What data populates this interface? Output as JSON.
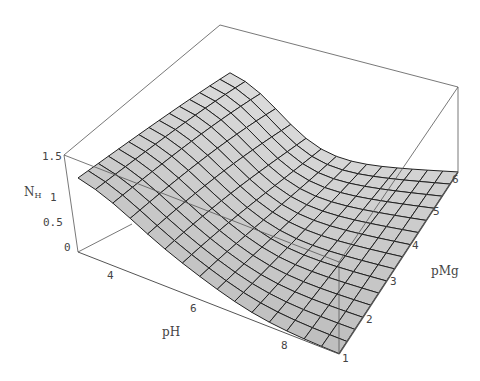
{
  "chart_data": {
    "type": "surface3d",
    "title": "",
    "x_axis": {
      "label": "pH",
      "ticks": [
        4,
        6,
        8
      ],
      "range": [
        3,
        9
      ]
    },
    "y_axis": {
      "label": "pMg",
      "ticks": [
        1,
        2,
        3,
        4,
        5,
        6
      ],
      "range": [
        1,
        6
      ]
    },
    "z_axis": {
      "label": "N",
      "label_subscript": "H",
      "ticks": [
        "0",
        "0.5",
        "1",
        "1.5"
      ],
      "range": [
        0,
        1.6
      ]
    },
    "grid": {
      "nx": 15,
      "ny": 15
    },
    "colors": {
      "surface": "#d0d0d0",
      "mesh": "#222222",
      "box": "#555555"
    }
  },
  "labels": {
    "z_name": "N",
    "z_sub": "H",
    "x_name": "pH",
    "y_name": "pMg",
    "z_ticks": [
      "1.5",
      "1",
      "0.5",
      "0"
    ],
    "x_ticks": [
      "4",
      "6",
      "8"
    ],
    "y_ticks": [
      "1",
      "2",
      "3",
      "4",
      "5",
      "6"
    ]
  }
}
